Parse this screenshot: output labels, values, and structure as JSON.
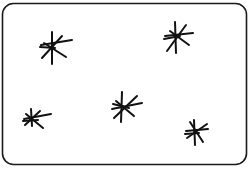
{
  "card": {
    "x": 2.5,
    "y": 3.5,
    "width": 244,
    "height": 161,
    "corner_radius": 11,
    "stroke": "#1a1a1a",
    "stroke_width": 1.6,
    "fill": "#ffffff"
  },
  "symbol": "asterisk",
  "count": 5,
  "ink_color": "#111111",
  "stars": [
    {
      "cx": 52,
      "cy": 47,
      "spokes": [
        [
          52,
          32,
          52,
          64
        ],
        [
          41,
          45,
          72,
          40
        ],
        [
          42,
          58,
          62,
          36
        ],
        [
          44,
          43,
          66,
          57
        ],
        [
          40,
          47,
          55,
          48
        ]
      ]
    },
    {
      "cx": 176,
      "cy": 37,
      "spokes": [
        [
          175,
          22,
          176,
          53
        ],
        [
          165,
          36,
          193,
          33
        ],
        [
          167,
          51,
          186,
          25
        ],
        [
          170,
          31,
          189,
          45
        ],
        [
          164,
          39,
          180,
          36
        ]
      ]
    },
    {
      "cx": 31,
      "cy": 119,
      "spokes": [
        [
          31,
          109,
          32,
          126
        ],
        [
          24,
          119,
          51,
          114
        ],
        [
          25,
          125,
          40,
          111
        ],
        [
          26,
          114,
          43,
          128
        ],
        [
          23,
          121,
          38,
          120
        ]
      ]
    },
    {
      "cx": 123,
      "cy": 107,
      "spokes": [
        [
          122,
          92,
          121,
          122
        ],
        [
          112,
          109,
          142,
          103
        ],
        [
          114,
          118,
          137,
          96
        ],
        [
          116,
          101,
          134,
          116
        ],
        [
          113,
          104,
          129,
          108
        ]
      ]
    },
    {
      "cx": 195,
      "cy": 131,
      "spokes": [
        [
          194,
          120,
          195,
          145
        ],
        [
          186,
          131,
          208,
          129
        ],
        [
          187,
          138,
          207,
          124
        ],
        [
          190,
          122,
          203,
          142
        ],
        [
          185,
          134,
          199,
          133
        ]
      ]
    }
  ]
}
